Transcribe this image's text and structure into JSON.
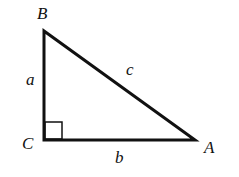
{
  "diagram": {
    "type": "right-triangle",
    "vertices": [
      {
        "label": "B",
        "x": 44,
        "y": 31
      },
      {
        "label": "C",
        "x": 44,
        "y": 140
      },
      {
        "label": "A",
        "x": 195,
        "y": 140
      }
    ],
    "vertex_labels": {
      "B": "B",
      "C": "C",
      "A": "A"
    },
    "side_labels": {
      "a": "a",
      "b": "b",
      "c": "c"
    },
    "right_angle_at": "C",
    "stroke_color": "#111111"
  }
}
